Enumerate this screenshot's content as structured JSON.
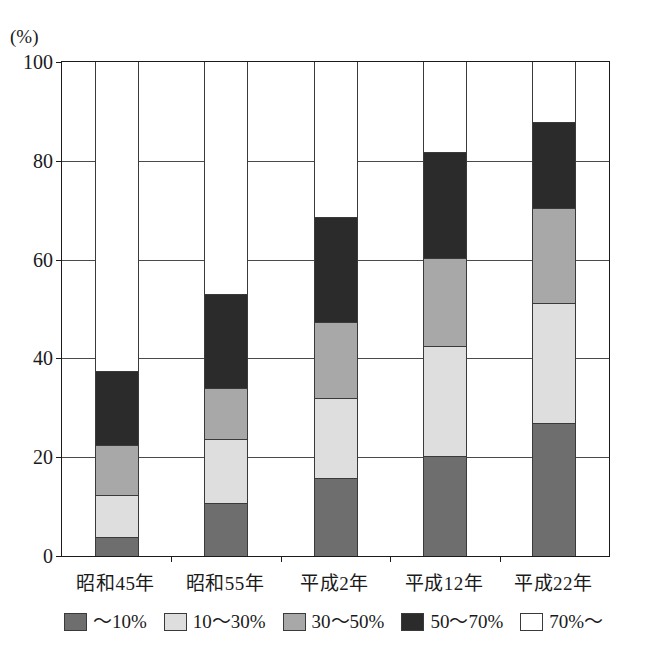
{
  "chart_data": {
    "type": "bar",
    "subtype": "stacked-bar-100",
    "title": "",
    "xlabel": "",
    "ylabel": "(%)",
    "unit_label": "(%)",
    "ylim": [
      0,
      100
    ],
    "ytick_values": [
      0,
      20,
      40,
      60,
      80,
      100
    ],
    "ytick_labels": [
      "0",
      "20",
      "40",
      "60",
      "80",
      "100"
    ],
    "grid": true,
    "grid_axis": "y",
    "legend_position": "bottom",
    "categories": [
      "昭和45年",
      "昭和55年",
      "平成2年",
      "平成12年",
      "平成22年"
    ],
    "series": [
      {
        "name": "～10%",
        "color": "#6e6e6e",
        "values": [
          3.8,
          10.7,
          15.8,
          20.2,
          26.9
        ]
      },
      {
        "name": "10～30%",
        "color": "#dedede",
        "values": [
          8.5,
          12.9,
          16.2,
          22.3,
          24.3
        ]
      },
      {
        "name": "30～50%",
        "color": "#a8a8a8",
        "values": [
          10.1,
          10.5,
          15.4,
          17.8,
          19.2
        ]
      },
      {
        "name": "50～70%",
        "color": "#2b2b2b",
        "values": [
          15.0,
          19.0,
          21.3,
          21.5,
          17.4
        ]
      },
      {
        "name": "70%～",
        "color": "#ffffff",
        "values": [
          62.6,
          46.9,
          31.3,
          18.2,
          12.2
        ]
      }
    ],
    "cumulative_tops": {
      "昭和45年": [
        3.8,
        12.3,
        22.4,
        37.4,
        100
      ],
      "昭和55年": [
        10.7,
        23.6,
        34.1,
        53.1,
        100
      ],
      "平成2年": [
        15.8,
        32.0,
        47.4,
        68.7,
        100
      ],
      "平成12年": [
        20.2,
        42.5,
        60.3,
        81.8,
        100
      ],
      "平成22年": [
        26.9,
        51.2,
        70.4,
        87.8,
        100
      ]
    }
  },
  "legend": {
    "items": [
      {
        "label": "～10%",
        "color": "#6e6e6e"
      },
      {
        "label": "10～30%",
        "color": "#dedede"
      },
      {
        "label": "30～50%",
        "color": "#a8a8a8"
      },
      {
        "label": "50～70%",
        "color": "#2b2b2b"
      },
      {
        "label": "70%～",
        "color": "#ffffff"
      }
    ]
  }
}
